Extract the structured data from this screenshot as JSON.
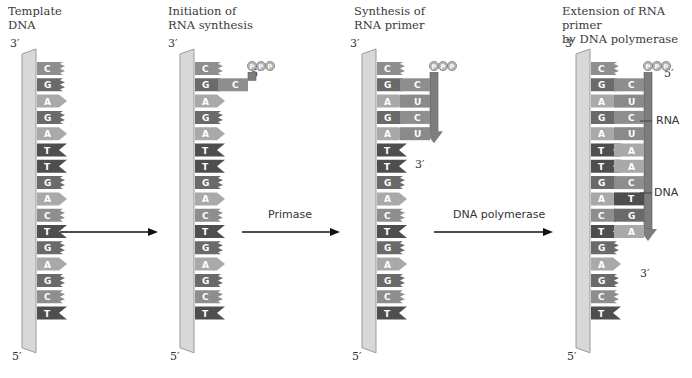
{
  "panels": [
    {
      "id": "template",
      "title_line1": "Template",
      "title_line2": "DNA",
      "end_top": "3′",
      "end_bottom": "5′"
    },
    {
      "id": "initiation",
      "title_line1": "Initiation of",
      "title_line2": "RNA synthesis",
      "end_top": "3′",
      "end_bottom": "5′"
    },
    {
      "id": "synthesis",
      "title_line1": "Synthesis of",
      "title_line2": "RNA primer",
      "end_top": "3′",
      "end_bottom": "5′"
    },
    {
      "id": "extension",
      "title_line1": "Extension of RNA primer",
      "title_line2": "by DNA polymerase",
      "end_top": "3′",
      "end_bottom": "5′"
    }
  ],
  "template_sequence": [
    "C",
    "G",
    "A",
    "G",
    "A",
    "T",
    "T",
    "G",
    "A",
    "C",
    "T",
    "G",
    "A",
    "G",
    "C",
    "T"
  ],
  "arrows": [
    {
      "label": ""
    },
    {
      "label": "Primase"
    },
    {
      "label": "DNA polymerase"
    }
  ],
  "initiation": {
    "new_strand": [
      "C"
    ],
    "triphosphate": "PPP",
    "five_prime": "5′"
  },
  "synthesis": {
    "new_strand": [
      "C",
      "U",
      "C",
      "U"
    ],
    "triphosphate": "PPP",
    "three_prime": "3′"
  },
  "extension": {
    "new_strand": [
      "C",
      "U",
      "C",
      "U",
      "A",
      "A",
      "C",
      "T",
      "G",
      "A"
    ],
    "triphosphate": "PPP",
    "five_prime": "5′",
    "three_prime": "3′",
    "rna_label": "RNA",
    "dna_label": "DNA"
  },
  "colors": {
    "bar": "#d8d8d8",
    "bar_edge": "#9a9a9a",
    "C": "#8e8e8e",
    "G": "#6a6a6a",
    "A": "#a9a9a9",
    "T": "#4e4e4e",
    "U": "#8a8a8a",
    "backbone": "#7d7d7d",
    "phosphate": "#b4b4b4"
  }
}
